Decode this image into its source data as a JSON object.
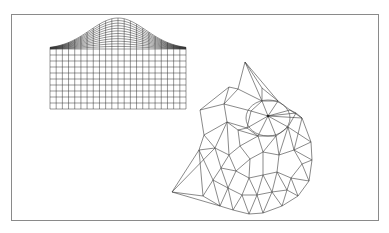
{
  "figure": {
    "frame_color": "#8a8a8a",
    "line_color": "#333333",
    "left_mesh": {
      "type": "gaussian-bump-grid",
      "columns": 22,
      "flat_rows": 10,
      "bump_rows": 12
    },
    "right_mesh": {
      "type": "triangulated-wireframe",
      "hub_point": [
        268,
        116
      ]
    }
  }
}
